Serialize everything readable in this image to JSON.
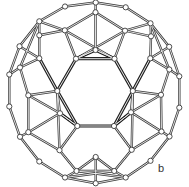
{
  "figure": {
    "label": "b",
    "label_pos": [
      158,
      162
    ],
    "colors": {
      "edge": "#3a3a3a",
      "node_fill": "#ffffff",
      "background": "#ffffff"
    }
  },
  "nodes": [
    [
      95.7,
      2.5
    ],
    [
      65,
      6.5
    ],
    [
      125.7,
      7.3
    ],
    [
      95.5,
      12.3
    ],
    [
      39.3,
      21.3
    ],
    [
      150.5,
      23.3
    ],
    [
      64.8,
      30.3
    ],
    [
      125,
      30.7
    ],
    [
      39.3,
      35.3
    ],
    [
      151,
      36.3
    ],
    [
      19.5,
      46.3
    ],
    [
      169.2,
      46.8
    ],
    [
      95.5,
      50
    ],
    [
      39.3,
      58.3
    ],
    [
      150.3,
      58.3
    ],
    [
      76,
      58.7
    ],
    [
      114.5,
      58.7
    ],
    [
      20,
      67.5
    ],
    [
      169.3,
      69.5
    ],
    [
      9.3,
      74.5
    ],
    [
      179.3,
      76.3
    ],
    [
      57.3,
      91
    ],
    [
      132.8,
      91
    ],
    [
      28.3,
      95.3
    ],
    [
      161,
      94.8
    ],
    [
      9.3,
      106.5
    ],
    [
      179.3,
      107.7
    ],
    [
      60,
      113.3
    ],
    [
      131,
      112.3
    ],
    [
      77.3,
      126
    ],
    [
      114,
      126
    ],
    [
      28.3,
      132.2
    ],
    [
      161.5,
      131.5
    ],
    [
      20,
      136.8
    ],
    [
      169.5,
      136.5
    ],
    [
      59.5,
      150.2
    ],
    [
      131.7,
      149.8
    ],
    [
      39.3,
      161.5
    ],
    [
      150.5,
      160.8
    ],
    [
      95.7,
      157
    ],
    [
      76.5,
      171
    ],
    [
      114.2,
      171
    ],
    [
      65,
      177.5
    ],
    [
      125.7,
      177.5
    ],
    [
      95.7,
      183.3
    ]
  ],
  "edges": [
    [
      0,
      1
    ],
    [
      0,
      2
    ],
    [
      0,
      3
    ],
    [
      1,
      4
    ],
    [
      2,
      5
    ],
    [
      3,
      6
    ],
    [
      3,
      7
    ],
    [
      3,
      12
    ],
    [
      6,
      16
    ],
    [
      7,
      15
    ],
    [
      6,
      15
    ],
    [
      7,
      16
    ],
    [
      12,
      15
    ],
    [
      12,
      16
    ],
    [
      4,
      6
    ],
    [
      4,
      8
    ],
    [
      4,
      10
    ],
    [
      4,
      17
    ],
    [
      8,
      6
    ],
    [
      8,
      13
    ],
    [
      10,
      13
    ],
    [
      10,
      19
    ],
    [
      17,
      13
    ],
    [
      17,
      19
    ],
    [
      17,
      23
    ],
    [
      5,
      7
    ],
    [
      5,
      9
    ],
    [
      5,
      11
    ],
    [
      5,
      18
    ],
    [
      9,
      7
    ],
    [
      9,
      14
    ],
    [
      11,
      14
    ],
    [
      11,
      20
    ],
    [
      18,
      14
    ],
    [
      18,
      20
    ],
    [
      18,
      24
    ],
    [
      19,
      25
    ],
    [
      25,
      33
    ],
    [
      20,
      26
    ],
    [
      26,
      34
    ],
    [
      23,
      21
    ],
    [
      23,
      27
    ],
    [
      23,
      31
    ],
    [
      27,
      21
    ],
    [
      27,
      29
    ],
    [
      27,
      31
    ],
    [
      31,
      33
    ],
    [
      31,
      35
    ],
    [
      35,
      29
    ],
    [
      21,
      35
    ],
    [
      24,
      22
    ],
    [
      24,
      28
    ],
    [
      24,
      32
    ],
    [
      28,
      22
    ],
    [
      28,
      30
    ],
    [
      28,
      32
    ],
    [
      32,
      34
    ],
    [
      32,
      36
    ],
    [
      36,
      30
    ],
    [
      22,
      36
    ],
    [
      33,
      37
    ],
    [
      37,
      42
    ],
    [
      34,
      38
    ],
    [
      38,
      43
    ],
    [
      35,
      40
    ],
    [
      36,
      41
    ],
    [
      39,
      40
    ],
    [
      39,
      41
    ],
    [
      39,
      44
    ],
    [
      40,
      42
    ],
    [
      41,
      43
    ],
    [
      42,
      44
    ],
    [
      43,
      44
    ],
    [
      40,
      43
    ],
    [
      41,
      42
    ],
    [
      40,
      41
    ]
  ],
  "bold_edges": [
    [
      15,
      16
    ],
    [
      16,
      22
    ],
    [
      22,
      30
    ],
    [
      30,
      29
    ],
    [
      29,
      21
    ],
    [
      21,
      15
    ],
    [
      15,
      12
    ],
    [
      16,
      12
    ],
    [
      13,
      21
    ],
    [
      14,
      22
    ],
    [
      27,
      29
    ],
    [
      28,
      30
    ]
  ]
}
